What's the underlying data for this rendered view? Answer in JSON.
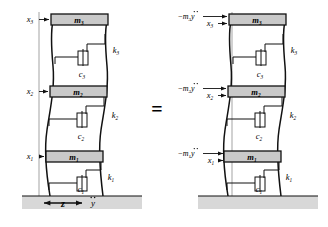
{
  "figure": {
    "type": "engineering-diagram",
    "equals_sign": "=",
    "colors": {
      "mass_fill": "#c9c9c9",
      "mass_stroke": "#111111",
      "ground_fill": "#d6d6d6",
      "column_stroke": "#111111",
      "reference_line": "#9a9a9a",
      "arrow": "#111111",
      "background": "#ffffff"
    },
    "left_model": {
      "name": "base-excited-model",
      "masses": [
        {
          "id": "m3",
          "label": "m",
          "sub": "3",
          "level": 3
        },
        {
          "id": "m2",
          "label": "m",
          "sub": "2",
          "level": 2
        },
        {
          "id": "m1",
          "label": "m",
          "sub": "1",
          "level": 1
        }
      ],
      "displacements": [
        {
          "id": "x3",
          "label": "x",
          "sub": "3",
          "level": 3
        },
        {
          "id": "x2",
          "label": "x",
          "sub": "2",
          "level": 2
        },
        {
          "id": "x1",
          "label": "x",
          "sub": "1",
          "level": 1
        }
      ],
      "stiffnesses": [
        {
          "id": "k3",
          "label": "k",
          "sub": "3",
          "level": 3
        },
        {
          "id": "k2",
          "label": "k",
          "sub": "2",
          "level": 2
        },
        {
          "id": "k1",
          "label": "k",
          "sub": "1",
          "level": 1
        }
      ],
      "dampers": [
        {
          "id": "c3",
          "label": "c",
          "sub": "3",
          "level": 3
        },
        {
          "id": "c2",
          "label": "c",
          "sub": "2",
          "level": 2
        },
        {
          "id": "c1",
          "label": "c",
          "sub": "1",
          "level": 1
        }
      ],
      "ground_motion": {
        "displacement_label": "z",
        "acceleration_label": "y",
        "acceleration_accent": "double-dot",
        "arrow_type": "double-headed-horizontal"
      }
    },
    "right_model": {
      "name": "equivalent-inertial-force-model",
      "masses": [
        {
          "id": "m3",
          "label": "m",
          "sub": "3",
          "level": 3
        },
        {
          "id": "m2",
          "label": "m",
          "sub": "2",
          "level": 2
        },
        {
          "id": "m1",
          "label": "m",
          "sub": "1",
          "level": 1
        }
      ],
      "displacements": [
        {
          "id": "x3",
          "label": "x",
          "sub": "3",
          "level": 3
        },
        {
          "id": "x2",
          "label": "x",
          "sub": "2",
          "level": 2
        },
        {
          "id": "x1",
          "label": "x",
          "sub": "1",
          "level": 1
        }
      ],
      "stiffnesses": [
        {
          "id": "k3",
          "label": "k",
          "sub": "3",
          "level": 3
        },
        {
          "id": "k2",
          "label": "k",
          "sub": "2",
          "level": 2
        },
        {
          "id": "k1",
          "label": "k",
          "sub": "1",
          "level": 1
        }
      ],
      "dampers": [
        {
          "id": "c3",
          "label": "c",
          "sub": "3",
          "level": 3
        },
        {
          "id": "c2",
          "label": "c",
          "sub": "2",
          "level": 2
        },
        {
          "id": "c1",
          "label": "c",
          "sub": "1",
          "level": 1
        }
      ],
      "inertial_forces": [
        {
          "id": "f3",
          "prefix": "−",
          "mass": "m",
          "sub": "3",
          "accel": "y",
          "accent": "double-dot",
          "level": 3
        },
        {
          "id": "f2",
          "prefix": "−",
          "mass": "m",
          "sub": "2",
          "accel": "y",
          "accent": "double-dot",
          "level": 2
        },
        {
          "id": "f1",
          "prefix": "−",
          "mass": "m",
          "sub": "1",
          "accel": "y",
          "accent": "double-dot",
          "level": 1
        }
      ],
      "base": "fixed-ground"
    }
  }
}
